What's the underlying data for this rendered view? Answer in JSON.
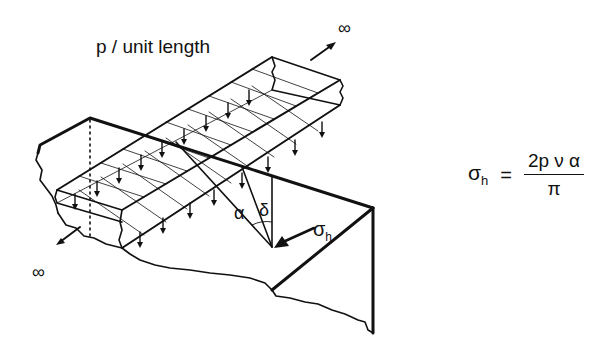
{
  "diagram": {
    "title": "p / unit length",
    "infinity_far": "∞",
    "infinity_near": "∞",
    "angle_alpha": "α",
    "angle_delta": "δ",
    "stress_label": "σ",
    "stress_subscript": "h",
    "line_color": "#111111",
    "background": "#ffffff"
  },
  "formula": {
    "lhs_symbol": "σ",
    "lhs_subscript": "h",
    "equals": "=",
    "numerator": "2p ν α",
    "denominator": "π"
  }
}
